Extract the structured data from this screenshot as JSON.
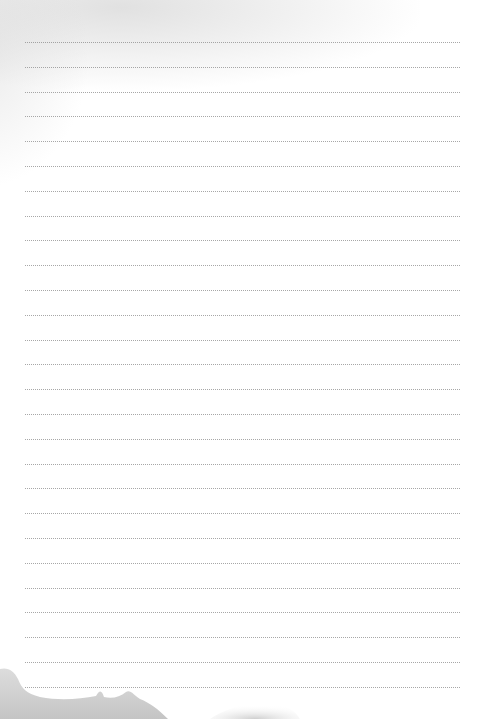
{
  "page": {
    "type": "lined-notepaper",
    "line_style": "dotted",
    "line_count": 27,
    "line_start_y": 42,
    "line_spacing": 24.8,
    "line_left": 25,
    "line_width": 435,
    "colors": {
      "paper": "#ffffff",
      "line": "#8a8a8a",
      "watercolor": "#c8c8c8"
    }
  }
}
